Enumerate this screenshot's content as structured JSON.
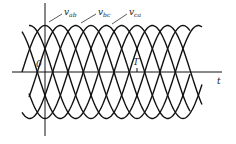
{
  "chart_data": {
    "type": "line",
    "title": "",
    "xlabel": "t",
    "ylabel": "",
    "origin_label": "0",
    "period_label": "T",
    "x_range_periods": [
      -0.25,
      1.7
    ],
    "amplitude": 1,
    "grid": false,
    "legend": "inline annotations with leader arrows",
    "series": [
      {
        "name": "v_ab",
        "label_main": "v",
        "label_sub": "ab",
        "phase_deg": 0
      },
      {
        "name": "v_bc",
        "label_main": "v",
        "label_sub": "bc",
        "phase_deg": -120
      },
      {
        "name": "v_ca",
        "label_main": "v",
        "label_sub": "ca",
        "phase_deg": 120
      }
    ],
    "extra_curves_note": "inverted copies (-v_ab, -v_bc, -v_ca) also drawn, forming six-pulse envelope"
  },
  "colors": {
    "line": "#111111",
    "background": "#ffffff"
  }
}
